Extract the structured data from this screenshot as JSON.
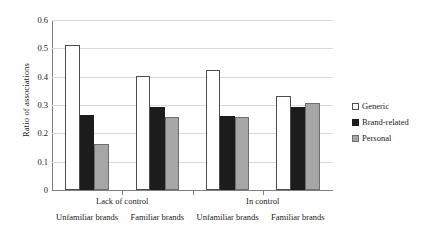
{
  "chart_data": {
    "type": "bar",
    "title": "",
    "xlabel": "",
    "ylabel": "Ratio of associations",
    "ylim": [
      0,
      0.6
    ],
    "ytick_labels": [
      "0.6",
      "0.5",
      "0.4",
      "0.3",
      "0.2",
      "0.1",
      "0"
    ],
    "ytick_values": [
      0.6,
      0.5,
      0.4,
      0.3,
      0.2,
      0.1,
      0
    ],
    "grid": "horizontal",
    "legend_position": "right",
    "categories": [
      "Unfamiliar brands",
      "Familiar brands",
      "Unfamiliar brands",
      "Familiar brands"
    ],
    "group_labels": [
      "Lack of control",
      "In control"
    ],
    "series": [
      {
        "name": "Generic",
        "color": "#ffffff",
        "values": [
          0.512,
          0.401,
          0.425,
          0.332
        ]
      },
      {
        "name": "Brand-related",
        "color": "#1c1c1c",
        "values": [
          0.266,
          0.293,
          0.261,
          0.294
        ]
      },
      {
        "name": "Personal",
        "color": "#a6a6a6",
        "values": [
          0.161,
          0.258,
          0.257,
          0.308
        ]
      }
    ]
  },
  "axes": {
    "y_title": "Ratio of associations"
  },
  "legend": {
    "items": [
      {
        "label": "Generic"
      },
      {
        "label": "Brand-related"
      },
      {
        "label": "Personal"
      }
    ]
  },
  "x_axis": {
    "top_tier": [
      {
        "label": "Lack of control"
      },
      {
        "label": "In control"
      }
    ],
    "bottom_tier": [
      {
        "label": "Unfamiliar brands"
      },
      {
        "label": "Familiar brands"
      },
      {
        "label": "Unfamiliar brands"
      },
      {
        "label": "Familiar brands"
      }
    ]
  }
}
